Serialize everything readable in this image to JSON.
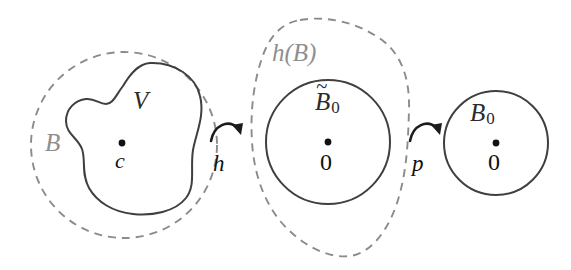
{
  "figure": {
    "background_color": "#ffffff",
    "width": 571,
    "height": 270
  },
  "colors": {
    "dashed_stroke": "#8b8b8b",
    "solid_stroke": "#3f3f3f",
    "arrow_stroke": "#1c1c1c",
    "label_gray": "#8f8f8f",
    "label_dark": "#2b2b2b",
    "label_black": "#111111"
  },
  "left_region": {
    "outer_set_label": "B",
    "outer_set_style": "dashed-circle",
    "inner_set_label": "V",
    "inner_set_style": "solid-irregular-blob",
    "center_point_label": "c",
    "center_point": {
      "x": 122,
      "y": 143
    }
  },
  "arrows": [
    {
      "name": "h",
      "label": "h",
      "from": "B",
      "to": "h(B)"
    },
    {
      "name": "p",
      "label": "p",
      "from": "h(B)",
      "to": "B_0"
    }
  ],
  "middle_region": {
    "outer_set_label": "h(B)",
    "outer_set_style": "dashed-irregular-blob",
    "inner_set_label_base": "B",
    "inner_set_label_accent": "~",
    "inner_set_label_subscript": "0",
    "inner_set_style": "solid-circle",
    "center_point_label": "0",
    "center_point": {
      "x": 328,
      "y": 142
    }
  },
  "right_region": {
    "set_label_base": "B",
    "set_label_subscript": "0",
    "set_style": "solid-circle",
    "center_point_label": "0",
    "center_point": {
      "x": 496,
      "y": 143
    }
  }
}
